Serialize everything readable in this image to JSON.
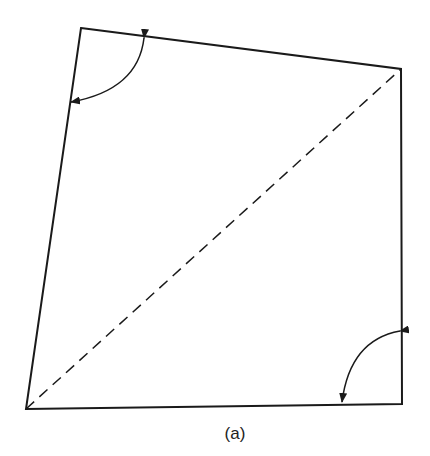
{
  "figure": {
    "caption": "(a)",
    "shape": "quadrilateral",
    "vertices": {
      "top_left": [
        81,
        28
      ],
      "top_right": [
        401,
        69
      ],
      "bottom_right": [
        402,
        404
      ],
      "bottom_left": [
        26,
        409
      ]
    },
    "diagonal": {
      "from": "bottom_left",
      "to": "top_right",
      "style": "dashed"
    },
    "angle_arcs": [
      {
        "vertex": "top_left",
        "style": "double-headed arrow"
      },
      {
        "vertex": "bottom_right",
        "style": "double-headed arrow"
      }
    ],
    "colors": {
      "stroke": "#1a1a1a",
      "background": "#ffffff"
    }
  }
}
